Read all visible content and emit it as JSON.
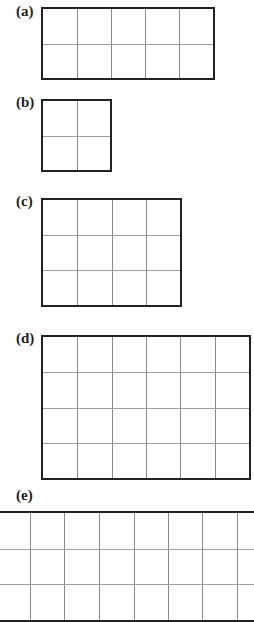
{
  "figures": [
    {
      "label": "(a)",
      "columns": 5,
      "rows": 2,
      "left": 41,
      "top": 7,
      "width": 174,
      "height": 73,
      "label_x": 16,
      "label_y": 4,
      "open_sides": false
    },
    {
      "label": "(b)",
      "columns": 2,
      "rows": 2,
      "left": 41,
      "top": 99,
      "width": 71,
      "height": 73,
      "label_x": 16,
      "label_y": 95,
      "open_sides": false
    },
    {
      "label": "(c)",
      "columns": 4,
      "rows": 3,
      "left": 41,
      "top": 198,
      "width": 141,
      "height": 109,
      "label_x": 16,
      "label_y": 194,
      "open_sides": false
    },
    {
      "label": "(d)",
      "columns": 6,
      "rows": 4,
      "left": 41,
      "top": 335,
      "width": 210,
      "height": 145,
      "label_x": 16,
      "label_y": 331,
      "open_sides": false
    },
    {
      "label": "(e)",
      "columns": 7,
      "rows": 3,
      "left": -4,
      "top": 511,
      "width": 262,
      "height": 111,
      "label_x": 16,
      "label_y": 488,
      "open_sides": true,
      "vertical_lines_x": [
        30,
        64,
        99,
        134,
        168,
        202,
        237
      ]
    }
  ],
  "colors": {
    "border": "#222222",
    "gridline": "#8a8a8a",
    "background": "#ffffff"
  }
}
